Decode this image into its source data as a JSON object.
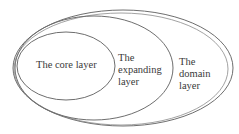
{
  "diagram": {
    "type": "nested-ellipses",
    "stroke_color": "#6e6e6e",
    "text_color": "#3a3a3a",
    "layers": [
      {
        "id": "core",
        "label": "The core layer"
      },
      {
        "id": "expanding",
        "label": "The\nexpanding\nlayer"
      },
      {
        "id": "domain",
        "label": "The\ndomain\nlayer"
      }
    ]
  }
}
